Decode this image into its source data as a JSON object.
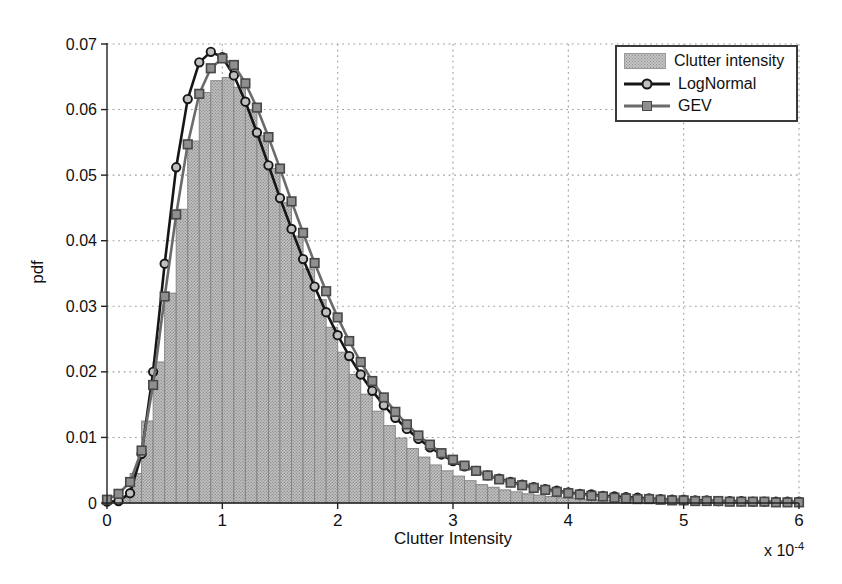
{
  "chart_data": {
    "type": "bar",
    "subtype": "histogram-with-fitted-curves",
    "title": "",
    "xlabel": "Clutter Intensity",
    "ylabel": "pdf",
    "x_offset_label": {
      "base": "x 10",
      "exponent": "-4"
    },
    "x_units_multiplier": "1e-4",
    "xlim": [
      0,
      6
    ],
    "ylim": [
      0,
      0.07
    ],
    "x_ticks": [
      0,
      1,
      2,
      3,
      4,
      5,
      6
    ],
    "x_tick_labels": [
      "0",
      "1",
      "2",
      "3",
      "4",
      "5",
      "6"
    ],
    "y_ticks": [
      0,
      0.01,
      0.02,
      0.03,
      0.04,
      0.05,
      0.06,
      0.07
    ],
    "y_tick_labels": [
      "0",
      "0.01",
      "0.02",
      "0.03",
      "0.04",
      "0.05",
      "0.06",
      "0.07"
    ],
    "grid": "dotted",
    "legend_position": "top-right",
    "colors": {
      "background": "#ffffff",
      "axis": "#222222",
      "text": "#111111",
      "grid": "#9e9e9e",
      "histogram_fill": "#c3c3c3",
      "histogram_dot": "#8f8f8f",
      "histogram_edge": "#858585",
      "lognormal_line": "#161616",
      "lognormal_marker_fill": "#bfbfbf",
      "gev_line": "#6b6b6b",
      "gev_marker_fill": "#8f8f8f",
      "gev_marker_edge": "#474747",
      "legend_border": "#3a3a3a"
    },
    "histogram": {
      "label": "Clutter intensity",
      "bin_start": 0,
      "bin_width": 0.1,
      "heights": [
        0.0002,
        0.0008,
        0.0045,
        0.0125,
        0.0215,
        0.032,
        0.0448,
        0.0552,
        0.0626,
        0.0644,
        0.0649,
        0.0634,
        0.06,
        0.056,
        0.051,
        0.0458,
        0.0407,
        0.0357,
        0.031,
        0.0268,
        0.023,
        0.0196,
        0.0166,
        0.014,
        0.0118,
        0.0099,
        0.0083,
        0.007,
        0.0058,
        0.0049,
        0.0041,
        0.0034,
        0.0028,
        0.0024,
        0.002,
        0.0017,
        0.0014,
        0.0012,
        0.001,
        0.0008,
        0.0007,
        0.0006,
        0.0005,
        0.00045,
        0.0004,
        0.00035,
        0.0003,
        0.00025,
        0.0002,
        0.0002,
        0.00018,
        0.00015,
        0.00013,
        0.00012,
        0.0001,
        0.0001,
        8e-05,
        8e-05,
        6e-05,
        6e-05
      ]
    },
    "series": [
      {
        "name": "LogNormal",
        "marker": "circle",
        "x_start": 0,
        "x_step": 0.1,
        "values": [
          0.0002,
          0.0003,
          0.0015,
          0.0075,
          0.02,
          0.0365,
          0.0512,
          0.0616,
          0.0672,
          0.0688,
          0.068,
          0.0652,
          0.0612,
          0.0565,
          0.0515,
          0.0465,
          0.0418,
          0.0372,
          0.033,
          0.0291,
          0.0256,
          0.0224,
          0.0196,
          0.0171,
          0.0149,
          0.013,
          0.0113,
          0.0098,
          0.0085,
          0.0074,
          0.0064,
          0.0056,
          0.0049,
          0.0042,
          0.0037,
          0.0032,
          0.0028,
          0.0024,
          0.0021,
          0.0019,
          0.0016,
          0.0014,
          0.0013,
          0.0011,
          0.001,
          0.0009,
          0.0008,
          0.0007,
          0.0006,
          0.0005,
          0.0005,
          0.0004,
          0.0004,
          0.0003,
          0.0003,
          0.0003,
          0.0002,
          0.0002,
          0.0002,
          0.0002,
          0.0002
        ]
      },
      {
        "name": "GEV",
        "marker": "square",
        "x_start": 0,
        "x_step": 0.1,
        "values": [
          0.0005,
          0.0014,
          0.0032,
          0.008,
          0.018,
          0.0315,
          0.044,
          0.0547,
          0.0624,
          0.0663,
          0.0678,
          0.0668,
          0.064,
          0.0603,
          0.0558,
          0.051,
          0.046,
          0.0412,
          0.0366,
          0.0323,
          0.0283,
          0.0247,
          0.0215,
          0.0186,
          0.0161,
          0.0139,
          0.012,
          0.0103,
          0.0089,
          0.0076,
          0.0066,
          0.0057,
          0.0049,
          0.0042,
          0.0036,
          0.0031,
          0.0027,
          0.0023,
          0.002,
          0.0017,
          0.0015,
          0.0013,
          0.0011,
          0.001,
          0.0008,
          0.0007,
          0.0006,
          0.0006,
          0.0005,
          0.0004,
          0.0004,
          0.0003,
          0.0003,
          0.0003,
          0.0002,
          0.0002,
          0.0002,
          0.0002,
          0.0001,
          0.0001,
          0.0001
        ]
      }
    ],
    "legend_entries": [
      "Clutter intensity",
      "LogNormal",
      "GEV"
    ]
  }
}
